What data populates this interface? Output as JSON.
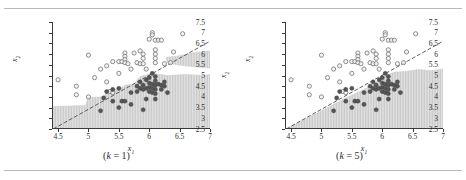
{
  "figure": {
    "panels": [
      {
        "id": "panel-k1",
        "caption_prefix": "(",
        "caption_k": "k",
        "caption_eq": " = ",
        "caption_value": "1",
        "caption_suffix": ")",
        "caption_full": "(k = 1)",
        "show_right_axis_label": true
      },
      {
        "id": "panel-k5",
        "caption_prefix": "(",
        "caption_k": "k",
        "caption_eq": " = ",
        "caption_value": "5",
        "caption_suffix": ")",
        "caption_full": "(k = 5)",
        "show_right_axis_label": false
      }
    ]
  },
  "chart_data": [
    {
      "type": "scatter",
      "title": "(k = 1)",
      "xlabel": "x1",
      "ylabel": "x2",
      "right_axis_label": "x2",
      "xlim": [
        4.4,
        7.0
      ],
      "ylim": [
        2.5,
        7.5
      ],
      "xticks": [
        4.5,
        5,
        5.5,
        6,
        6.5,
        7
      ],
      "xticklabels": [
        "4.5",
        "5",
        "5.5",
        "6",
        "6.5",
        "7"
      ],
      "yticks": [
        2.5,
        3,
        3.5,
        4,
        4.5,
        5,
        5.5,
        6,
        6.5,
        7,
        7.5
      ],
      "yticklabels": [
        "2.5",
        "3",
        "3.5",
        "4",
        "4.5",
        "5",
        "5.5",
        "6",
        "6.5",
        "7",
        "7.5"
      ],
      "grid": false,
      "legend": "none",
      "series": [
        {
          "name": "class-1-open",
          "marker": "open-circle",
          "color": "#808080",
          "points": [
            [
              4.5,
              4.8
            ],
            [
              4.8,
              4.5
            ],
            [
              4.8,
              4.1
            ],
            [
              5.0,
              5.95
            ],
            [
              5.0,
              4.0
            ],
            [
              5.1,
              4.9
            ],
            [
              5.2,
              5.3
            ],
            [
              5.3,
              5.45
            ],
            [
              5.3,
              4.7
            ],
            [
              5.35,
              4.25
            ],
            [
              5.4,
              5.65
            ],
            [
              5.4,
              4.2
            ],
            [
              5.5,
              5.65
            ],
            [
              5.5,
              5.1
            ],
            [
              5.55,
              5.65
            ],
            [
              5.6,
              6.05
            ],
            [
              5.6,
              5.9
            ],
            [
              5.6,
              5.75
            ],
            [
              5.6,
              5.6
            ],
            [
              5.65,
              5.55
            ],
            [
              5.7,
              5.3
            ],
            [
              5.75,
              6.05
            ],
            [
              5.8,
              5.6
            ],
            [
              5.85,
              6.15
            ],
            [
              5.85,
              5.55
            ],
            [
              5.9,
              6.0
            ],
            [
              5.9,
              5.8
            ],
            [
              5.9,
              5.55
            ],
            [
              5.95,
              5.3
            ],
            [
              6.0,
              6.7
            ],
            [
              6.05,
              7.0
            ],
            [
              6.05,
              6.9
            ],
            [
              6.1,
              6.65
            ],
            [
              6.1,
              6.2
            ],
            [
              6.1,
              6.0
            ],
            [
              6.1,
              5.8
            ],
            [
              6.1,
              5.6
            ],
            [
              6.15,
              6.65
            ],
            [
              6.2,
              6.65
            ],
            [
              6.25,
              5.55
            ],
            [
              6.35,
              5.6
            ],
            [
              6.4,
              6.1
            ],
            [
              6.55,
              6.95
            ]
          ]
        },
        {
          "name": "class-2-filled",
          "marker": "filled-circle",
          "color": "#555555",
          "points": [
            [
              5.2,
              3.35
            ],
            [
              5.25,
              3.95
            ],
            [
              5.3,
              4.25
            ],
            [
              5.4,
              4.35
            ],
            [
              5.4,
              3.8
            ],
            [
              5.5,
              4.4
            ],
            [
              5.5,
              3.5
            ],
            [
              5.55,
              3.8
            ],
            [
              5.6,
              3.8
            ],
            [
              5.7,
              4.2
            ],
            [
              5.7,
              3.65
            ],
            [
              5.8,
              4.5
            ],
            [
              5.8,
              4.25
            ],
            [
              5.85,
              4.7
            ],
            [
              5.85,
              4.4
            ],
            [
              5.9,
              4.55
            ],
            [
              5.9,
              4.35
            ],
            [
              5.9,
              3.4
            ],
            [
              5.95,
              4.8
            ],
            [
              5.95,
              4.4
            ],
            [
              6.0,
              4.9
            ],
            [
              6.0,
              4.65
            ],
            [
              6.0,
              4.45
            ],
            [
              6.0,
              4.25
            ],
            [
              6.05,
              5.1
            ],
            [
              6.05,
              4.6
            ],
            [
              6.05,
              4.4
            ],
            [
              6.05,
              4.2
            ],
            [
              6.1,
              4.95
            ],
            [
              6.1,
              4.75
            ],
            [
              6.1,
              4.55
            ],
            [
              6.1,
              4.35
            ],
            [
              6.1,
              4.15
            ],
            [
              6.15,
              4.6
            ],
            [
              6.2,
              4.55
            ],
            [
              6.2,
              4.35
            ],
            [
              6.25,
              4.7
            ],
            [
              6.25,
              4.5
            ],
            [
              6.3,
              4.2
            ],
            [
              6.1,
              3.9
            ],
            [
              5.95,
              3.9
            ]
          ]
        }
      ],
      "boundary_line": {
        "name": "diagonal-decision-line",
        "style": "dashed",
        "color": "#4d4d59",
        "from": [
          4.42,
          2.5
        ],
        "to": [
          7.0,
          6.6
        ]
      },
      "shaded_region": {
        "name": "knn-decision-region-k1",
        "fill": "#d6d6d6",
        "hatch": "vertical-lines",
        "description": "jagged irregular region below/right of boundary plus separate upper-right lobe",
        "lower_region_path": [
          [
            4.42,
            2.5
          ],
          [
            4.42,
            3.55
          ],
          [
            4.95,
            3.6
          ],
          [
            5.0,
            3.98
          ],
          [
            5.25,
            4.0
          ],
          [
            5.3,
            4.3
          ],
          [
            5.5,
            4.35
          ],
          [
            5.6,
            4.55
          ],
          [
            5.75,
            4.6
          ],
          [
            5.85,
            4.95
          ],
          [
            6.05,
            5.1
          ],
          [
            6.3,
            5.0
          ],
          [
            6.6,
            5.05
          ],
          [
            6.9,
            5.0
          ],
          [
            7.0,
            5.05
          ],
          [
            7.0,
            2.5
          ]
        ],
        "upper_lobe_path": [
          [
            6.28,
            5.85
          ],
          [
            6.45,
            5.9
          ],
          [
            6.7,
            6.05
          ],
          [
            7.0,
            6.15
          ],
          [
            7.0,
            5.35
          ],
          [
            6.7,
            5.42
          ],
          [
            6.45,
            5.5
          ],
          [
            6.3,
            5.6
          ]
        ]
      }
    },
    {
      "type": "scatter",
      "title": "(k = 5)",
      "xlabel": "x1",
      "ylabel": "x2",
      "right_axis_label": "",
      "xlim": [
        4.4,
        7.0
      ],
      "ylim": [
        2.5,
        7.5
      ],
      "xticks": [
        4.5,
        5,
        5.5,
        6,
        6.5,
        7
      ],
      "xticklabels": [
        "4.5",
        "5",
        "5.5",
        "6",
        "6.5",
        "7"
      ],
      "yticks": [
        2.5,
        3,
        3.5,
        4,
        4.5,
        5,
        5.5,
        6,
        6.5,
        7,
        7.5
      ],
      "yticklabels": [
        "2.5",
        "3",
        "3.5",
        "4",
        "4.5",
        "5",
        "5.5",
        "6",
        "6.5",
        "7",
        "7.5"
      ],
      "grid": false,
      "legend": "none",
      "series": [
        {
          "name": "class-1-open",
          "marker": "open-circle",
          "color": "#808080",
          "points": [
            [
              4.5,
              4.8
            ],
            [
              4.8,
              4.5
            ],
            [
              4.8,
              4.1
            ],
            [
              5.0,
              5.95
            ],
            [
              5.0,
              4.0
            ],
            [
              5.1,
              4.9
            ],
            [
              5.2,
              5.3
            ],
            [
              5.3,
              5.45
            ],
            [
              5.3,
              4.7
            ],
            [
              5.35,
              4.25
            ],
            [
              5.4,
              5.65
            ],
            [
              5.4,
              4.2
            ],
            [
              5.5,
              5.65
            ],
            [
              5.5,
              5.1
            ],
            [
              5.55,
              5.65
            ],
            [
              5.6,
              6.05
            ],
            [
              5.6,
              5.9
            ],
            [
              5.6,
              5.75
            ],
            [
              5.6,
              5.6
            ],
            [
              5.65,
              5.55
            ],
            [
              5.7,
              5.3
            ],
            [
              5.75,
              6.05
            ],
            [
              5.8,
              5.6
            ],
            [
              5.85,
              6.15
            ],
            [
              5.85,
              5.55
            ],
            [
              5.9,
              6.0
            ],
            [
              5.9,
              5.8
            ],
            [
              5.9,
              5.55
            ],
            [
              5.95,
              5.3
            ],
            [
              6.0,
              6.7
            ],
            [
              6.05,
              7.0
            ],
            [
              6.05,
              6.9
            ],
            [
              6.1,
              6.65
            ],
            [
              6.1,
              6.2
            ],
            [
              6.1,
              6.0
            ],
            [
              6.1,
              5.8
            ],
            [
              6.1,
              5.6
            ],
            [
              6.15,
              6.65
            ],
            [
              6.2,
              6.65
            ],
            [
              6.25,
              5.55
            ],
            [
              6.35,
              5.6
            ],
            [
              6.4,
              6.1
            ],
            [
              6.55,
              6.95
            ]
          ]
        },
        {
          "name": "class-2-filled",
          "marker": "filled-circle",
          "color": "#555555",
          "points": [
            [
              5.2,
              3.35
            ],
            [
              5.25,
              3.95
            ],
            [
              5.3,
              4.25
            ],
            [
              5.4,
              4.35
            ],
            [
              5.4,
              3.8
            ],
            [
              5.5,
              4.4
            ],
            [
              5.5,
              3.5
            ],
            [
              5.55,
              3.8
            ],
            [
              5.6,
              3.8
            ],
            [
              5.7,
              4.2
            ],
            [
              5.7,
              3.65
            ],
            [
              5.8,
              4.5
            ],
            [
              5.8,
              4.25
            ],
            [
              5.85,
              4.7
            ],
            [
              5.85,
              4.4
            ],
            [
              5.9,
              4.55
            ],
            [
              5.9,
              4.35
            ],
            [
              5.9,
              3.4
            ],
            [
              5.95,
              4.8
            ],
            [
              5.95,
              4.4
            ],
            [
              6.0,
              4.9
            ],
            [
              6.0,
              4.65
            ],
            [
              6.0,
              4.45
            ],
            [
              6.0,
              4.25
            ],
            [
              6.05,
              5.1
            ],
            [
              6.05,
              4.6
            ],
            [
              6.05,
              4.4
            ],
            [
              6.05,
              4.2
            ],
            [
              6.1,
              4.95
            ],
            [
              6.1,
              4.75
            ],
            [
              6.1,
              4.55
            ],
            [
              6.1,
              4.35
            ],
            [
              6.1,
              4.15
            ],
            [
              6.15,
              4.6
            ],
            [
              6.2,
              4.55
            ],
            [
              6.2,
              4.35
            ],
            [
              6.25,
              4.7
            ],
            [
              6.25,
              4.5
            ],
            [
              6.3,
              4.2
            ],
            [
              6.1,
              3.9
            ],
            [
              5.95,
              3.9
            ]
          ]
        }
      ],
      "boundary_line": {
        "name": "diagonal-decision-line",
        "style": "dashed",
        "color": "#4d4d59",
        "from": [
          4.42,
          2.5
        ],
        "to": [
          7.0,
          6.6
        ]
      },
      "shaded_region": {
        "name": "knn-decision-region-k5",
        "fill": "#d6d6d6",
        "hatch": "vertical-lines",
        "description": "smooth region hugging the diagonal, flattening near x2 = 5.2 to the right",
        "lower_region_path": [
          [
            4.42,
            2.5
          ],
          [
            5.0,
            3.35
          ],
          [
            5.4,
            3.95
          ],
          [
            5.7,
            4.35
          ],
          [
            5.9,
            4.7
          ],
          [
            6.05,
            5.0
          ],
          [
            6.2,
            5.15
          ],
          [
            6.4,
            5.2
          ],
          [
            6.6,
            5.28
          ],
          [
            6.8,
            5.22
          ],
          [
            7.0,
            5.3
          ],
          [
            7.0,
            2.5
          ]
        ],
        "upper_lobe_path": []
      }
    }
  ]
}
